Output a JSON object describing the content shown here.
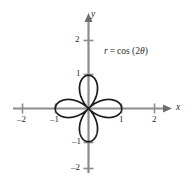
{
  "figure": {
    "title": "",
    "equation_label": "r = cos (2θ)",
    "equation_parts": {
      "r": "r",
      "equals": "=",
      "func": "cos (2",
      "theta": "θ",
      "close": ")"
    },
    "colors": {
      "curve": "#1a1a1a",
      "axis": "#8c8c8c",
      "text": "#2b2b2b",
      "background": "#ffffff"
    }
  },
  "axes": {
    "x_name": "x",
    "y_name": "y",
    "x_ticks": [
      {
        "label": "–2",
        "value": -2
      },
      {
        "label": "–1",
        "value": -1
      },
      {
        "label": "1",
        "value": 1
      },
      {
        "label": "2",
        "value": 2
      }
    ],
    "y_ticks": [
      {
        "label": "2",
        "value": 2
      },
      {
        "label": "1",
        "value": 1
      },
      {
        "label": "–1",
        "value": -1
      },
      {
        "label": "–2",
        "value": -2
      }
    ],
    "xlim": [
      -2.3,
      2.3
    ],
    "ylim": [
      -2.3,
      2.3
    ]
  },
  "chart_data": {
    "type": "line",
    "plot_kind": "polar-rose",
    "title": "",
    "xlabel": "x",
    "ylabel": "y",
    "annotations": [
      "r = cos (2θ)"
    ],
    "grid": false,
    "legend": null,
    "xlim": [
      -2.3,
      2.3
    ],
    "ylim": [
      -2.3,
      2.3
    ],
    "xticks": [
      -2,
      -1,
      1,
      2
    ],
    "yticks": [
      -2,
      -1,
      1,
      2
    ],
    "equation": "r = cos(2*theta)",
    "petals": 4,
    "max_radius": 1,
    "petal_axis_angles_deg": [
      0,
      90,
      180,
      270
    ],
    "series": [
      {
        "name": "r = cos (2θ)",
        "color": "#1a1a1a",
        "polar": true,
        "theta_range_deg": [
          0,
          360
        ],
        "r_of_theta": "cos(2*theta)",
        "points_polar": [
          [
            0,
            1.0
          ],
          [
            10,
            0.94
          ],
          [
            20,
            0.766
          ],
          [
            30,
            0.5
          ],
          [
            40,
            0.174
          ],
          [
            45,
            0.0
          ],
          [
            50,
            -0.174
          ],
          [
            60,
            -0.5
          ],
          [
            70,
            -0.766
          ],
          [
            80,
            -0.94
          ],
          [
            90,
            -1.0
          ],
          [
            100,
            -0.94
          ],
          [
            110,
            -0.766
          ],
          [
            120,
            -0.5
          ],
          [
            130,
            -0.174
          ],
          [
            135,
            0.0
          ],
          [
            140,
            0.174
          ],
          [
            150,
            0.5
          ],
          [
            160,
            0.766
          ],
          [
            170,
            0.94
          ],
          [
            180,
            1.0
          ],
          [
            190,
            0.94
          ],
          [
            200,
            0.766
          ],
          [
            210,
            0.5
          ],
          [
            220,
            0.174
          ],
          [
            225,
            0.0
          ],
          [
            230,
            -0.174
          ],
          [
            240,
            -0.5
          ],
          [
            250,
            -0.766
          ],
          [
            260,
            -0.94
          ],
          [
            270,
            -1.0
          ],
          [
            280,
            -0.94
          ],
          [
            290,
            -0.766
          ],
          [
            300,
            -0.5
          ],
          [
            310,
            -0.174
          ],
          [
            315,
            0.0
          ],
          [
            320,
            0.174
          ],
          [
            330,
            0.5
          ],
          [
            340,
            0.766
          ],
          [
            350,
            0.94
          ],
          [
            360,
            1.0
          ]
        ]
      }
    ]
  }
}
